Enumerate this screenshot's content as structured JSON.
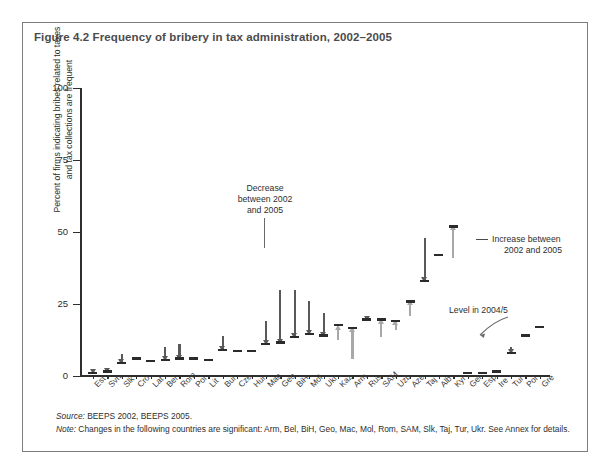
{
  "figure": {
    "title": "Figure 4.2  Frequency of bribery in tax administration, 2002–2005",
    "source_label": "Source:",
    "source_text": " BEEPS 2002, BEEPS 2005.",
    "note_label": "Note:",
    "note_text": " Changes in the following countries are significant: Arm, Bel, BiH, Geo, Mac, Mol, Rom, SAM, Slk, Taj, Tur, Ukr. See Annex for details."
  },
  "annotations": {
    "decrease": "Decrease\nbetween 2002\nand 2005",
    "decrease_line1": "Decrease",
    "decrease_line2": "between 2002",
    "decrease_line3": "and 2005",
    "increase_line1": "Increase between",
    "increase_line2": "2002 and 2005",
    "level": "Level in 2004/5"
  },
  "colors": {
    "level_bar": "#2b2b2b",
    "decrease_arrow": "#59595c",
    "increase_arrow": "#a8a8ab",
    "axis": "#2e2e2e",
    "frame": "#7d7d7d",
    "title": "#4b4b4b"
  },
  "chart_data": {
    "type": "bar",
    "title": "Figure 4.2  Frequency of bribery in tax administration, 2002–2005",
    "subtitle": "",
    "xlabel": "",
    "ylabel": "Percent of firms indicating bribes related to taxes and tax collections are frequent",
    "ylabel_line1": "Percent of firms indicating bribes related to taxes",
    "ylabel_line2": "and tax collections are frequent",
    "ylim": [
      0,
      100
    ],
    "yticks": [
      0,
      25,
      50,
      75,
      100
    ],
    "grid": false,
    "legend_position": "inline-annotations",
    "categories": [
      "Est",
      "Svn",
      "Slk",
      "Cro",
      "Lat",
      "Bel",
      "Rom",
      "Pol",
      "Lit",
      "Bul",
      "Cze",
      "Hun",
      "Mac",
      "Geo",
      "BiH",
      "Mol",
      "Ukr",
      "Kaz",
      "Arm",
      "Rus",
      "SAM",
      "Uzb",
      "Aze",
      "Taj",
      "Alb",
      "Kyr",
      "Ger",
      "Esp",
      "Ire",
      "Tur",
      "Por",
      "Gre"
    ],
    "series": [
      {
        "name": "Level in 2004/5",
        "values": [
          1.0,
          1.5,
          4.5,
          6.0,
          5.0,
          5.5,
          6.0,
          6.0,
          5.5,
          9.0,
          8.5,
          8.5,
          11.0,
          11.5,
          13.5,
          14.5,
          14.0,
          17.5,
          16.5,
          19.5,
          19.5,
          19.0,
          26.0,
          33.0,
          42.0,
          52.0,
          1.0,
          1.0,
          1.5,
          8.0,
          14.0,
          17.0
        ]
      },
      {
        "name": "Level in 2002",
        "values": [
          2.0,
          2.5,
          7.5,
          6.0,
          5.0,
          10.0,
          11.0,
          6.0,
          5.5,
          14.0,
          8.5,
          8.5,
          19.0,
          30.0,
          30.0,
          26.0,
          22.0,
          12.5,
          6.0,
          17.0,
          13.5,
          16.0,
          21.0,
          48.0,
          42.0,
          41.0,
          1.0,
          1.0,
          1.5,
          10.0,
          14.0,
          17.0
        ]
      }
    ],
    "changes": [
      "decrease",
      "decrease",
      "decrease",
      "none",
      "none",
      "decrease",
      "decrease",
      "none",
      "none",
      "decrease",
      "none",
      "none",
      "decrease",
      "decrease",
      "decrease",
      "decrease",
      "decrease",
      "increase",
      "increase",
      "decrease",
      "increase",
      "increase",
      "increase",
      "decrease",
      "none",
      "increase",
      "none",
      "none",
      "none",
      "decrease",
      "none",
      "none"
    ]
  }
}
